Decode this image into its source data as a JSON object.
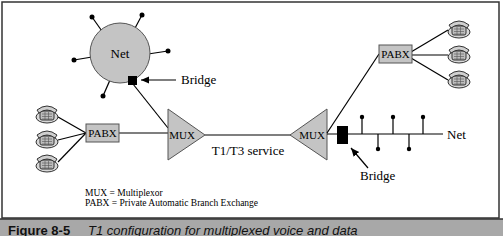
{
  "diagram": {
    "net_cloud": {
      "label": "Net"
    },
    "top_bridge": {
      "label": "Bridge"
    },
    "left_pabx": {
      "label": "PABX"
    },
    "right_pabx": {
      "label": "PABX"
    },
    "left_mux": {
      "label": "MUX"
    },
    "right_mux": {
      "label": "MUX"
    },
    "link": {
      "label": "T1/T3 service"
    },
    "bus": {
      "label": "Net"
    },
    "bottom_bridge": {
      "label": "Bridge"
    },
    "legend": [
      {
        "text": "MUX = Multiplexor"
      },
      {
        "text": "PABX = Private Automatic Branch Exchange"
      }
    ],
    "colors": {
      "shape_fill": "#c4c4c4",
      "line": "#000000",
      "caption_bar": "#a8a8a8"
    }
  },
  "caption": {
    "figure_number": "Figure 8-5",
    "title": "T1 configuration for multiplexed voice and data"
  }
}
